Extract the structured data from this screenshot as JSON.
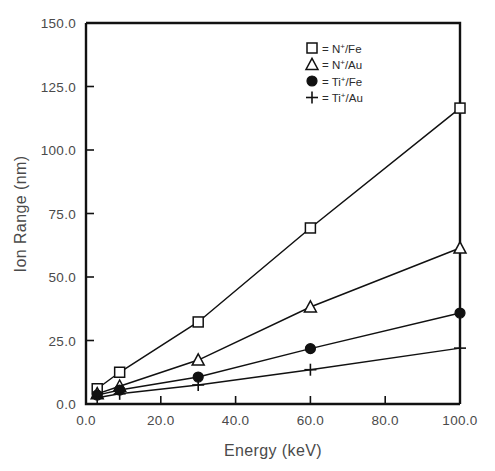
{
  "chart_data": {
    "type": "line",
    "title": "",
    "xlabel": "Energy (keV)",
    "ylabel": "Ion Range (nm)",
    "xlim": [
      0.0,
      100.0
    ],
    "ylim": [
      0.0,
      150.0
    ],
    "xticks": [
      "0.0",
      "20.0",
      "40.0",
      "60.0",
      "80.0",
      "100.0"
    ],
    "xtick_values": [
      0,
      20,
      40,
      60,
      80,
      100
    ],
    "yticks": [
      "0.0",
      "25.0",
      "50.0",
      "75.0",
      "100.0",
      "125.0",
      "150.0"
    ],
    "ytick_values": [
      0,
      25,
      50,
      75,
      100,
      125,
      150
    ],
    "grid": false,
    "legend_position": "top-right",
    "x": [
      3,
      9,
      30,
      60,
      100
    ],
    "series": [
      {
        "name": "N+/Fe",
        "marker": "square-open",
        "legend_base": "N",
        "legend_sup": "+",
        "legend_tail": "/Fe",
        "values": [
          6.0,
          12.5,
          32.3,
          69.3,
          116.5
        ]
      },
      {
        "name": "N+/Au",
        "marker": "triangle-open",
        "legend_base": "N",
        "legend_sup": "+",
        "legend_tail": "/Au",
        "values": [
          4.0,
          7.0,
          17.3,
          38.2,
          61.4
        ]
      },
      {
        "name": "Ti+/Fe",
        "marker": "circle-filled",
        "legend_base": "Ti",
        "legend_sup": "+",
        "legend_tail": "/Fe",
        "values": [
          3.5,
          5.5,
          10.6,
          21.8,
          35.8
        ]
      },
      {
        "name": "Ti+/Au",
        "marker": "plus",
        "legend_base": "Ti",
        "legend_sup": "+",
        "legend_tail": "/Au",
        "values": [
          2.5,
          4.0,
          7.5,
          13.5,
          22.0
        ]
      }
    ],
    "legend_separator": "=",
    "colors": {
      "line": "#111111",
      "marker_fill": "#ffffff",
      "marker_stroke": "#111111",
      "text": "#4a4a4a",
      "background": "#ffffff"
    }
  }
}
